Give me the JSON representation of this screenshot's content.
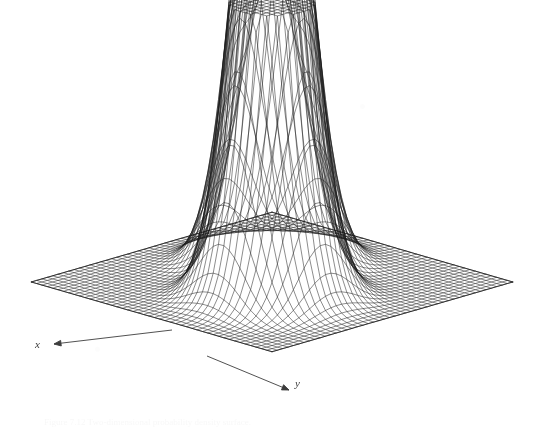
{
  "figure": {
    "kind": "3d-wireframe-surface-plot",
    "caption": "Figure 7.12  Two-dimensional probability density surface.",
    "background_color": "#ffffff",
    "line_color": "#1a1a1a",
    "axis_label_color": "#3d3d3d"
  },
  "axes": {
    "x": {
      "label": "x",
      "arrow_from": [
        172,
        330
      ],
      "arrow_to": [
        54,
        344
      ]
    },
    "y": {
      "label": "y",
      "arrow_from": [
        207,
        356
      ],
      "arrow_to": [
        289,
        390
      ]
    }
  },
  "chart_data": {
    "type": "surface",
    "title": "",
    "xlabel": "x",
    "ylabel": "y",
    "zlabel": "",
    "grid": true,
    "legend": false,
    "style": "wireframe-mesh",
    "mesh": {
      "nx": 46,
      "ny": 46,
      "x_range": [
        -3.2,
        3.2
      ],
      "y_range": [
        -3.2,
        3.2
      ]
    },
    "z_clip": 1.0,
    "zlim": [
      0,
      1.0
    ],
    "projection": {
      "type": "oblique-isometric",
      "origin": [
        272,
        288
      ],
      "x_axis_screen_step": [
        -5.35,
        -1.55
      ],
      "y_axis_screen_step": [
        5.35,
        -1.55
      ],
      "z_scale": 300
    },
    "peaks": [
      {
        "name": "peak-back-left",
        "center": [
          -0.72,
          -0.72
        ],
        "amplitude": 2.35,
        "sigma": 0.62,
        "screen_top": [
          230,
          26
        ]
      },
      {
        "name": "peak-front-right",
        "center": [
          0.78,
          0.78
        ],
        "amplitude": 2.05,
        "sigma": 0.62,
        "screen_top": [
          343,
          86
        ]
      }
    ],
    "base_level": 0.02,
    "surface_corners_screen": {
      "left": [
        20,
        266
      ],
      "top_hidden": [
        272,
        150
      ],
      "right": [
        521,
        305
      ],
      "front": [
        290,
        362
      ]
    }
  }
}
